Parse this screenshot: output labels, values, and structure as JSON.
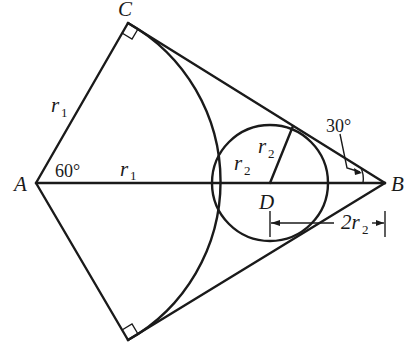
{
  "diagram": {
    "points": {
      "A": {
        "label": "A",
        "x": 36,
        "y": 183
      },
      "B": {
        "label": "B",
        "x": 385,
        "y": 183
      },
      "C": {
        "label": "C",
        "x": 128,
        "y": 23
      },
      "C_lower": {
        "label": "",
        "x": 128,
        "y": 340
      },
      "D": {
        "label": "D",
        "x": 270,
        "y": 183
      }
    },
    "labels": {
      "A": "A",
      "B": "B",
      "C": "C",
      "D": "D",
      "r1_side": "r",
      "r1_side_sub": "1",
      "r1_axis": "r",
      "r1_axis_sub": "1",
      "r2_left": "r",
      "r2_left_sub": "2",
      "r2_radius": "r",
      "r2_radius_sub": "2",
      "dim_2r2_coef": "2r",
      "dim_2r2_sub": "2",
      "angle_A": "60°",
      "angle_B": "30°"
    },
    "circle": {
      "center": "D",
      "radius": "r2"
    },
    "arc": {
      "center": "A",
      "radius": "r1",
      "from": "C",
      "to": "C_lower"
    },
    "right_angle_marks": [
      "C",
      "C_lower"
    ],
    "dimension": {
      "from": "D",
      "to": "B",
      "value": "2r2"
    }
  }
}
